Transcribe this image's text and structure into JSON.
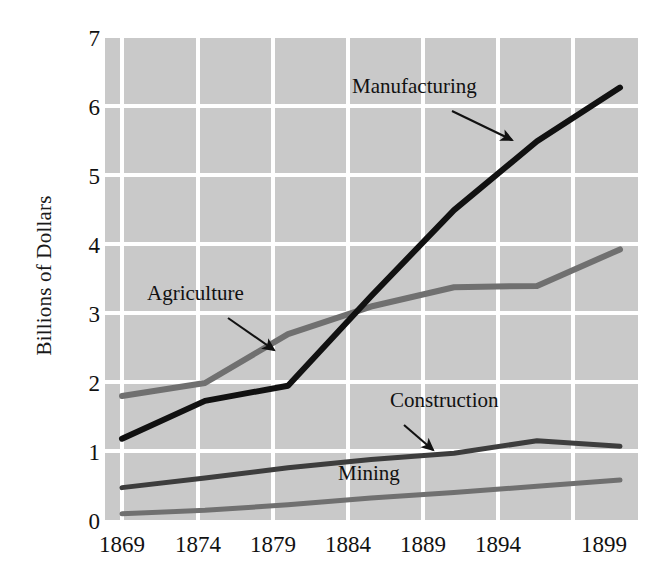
{
  "chart_data": {
    "type": "line",
    "title": "",
    "subtitle": "",
    "xlabel": "",
    "ylabel": "Billions of Dollars",
    "x": [
      1869,
      1874,
      1879,
      1884,
      1889,
      1894,
      1899
    ],
    "categories": [
      "1869",
      "1874",
      "1879",
      "1884",
      "1889",
      "1894",
      "1899"
    ],
    "xtick_labels": [
      "1869",
      "1874",
      "1879",
      "1884",
      "1889",
      "1894",
      "1899"
    ],
    "ytick_labels": [
      "0",
      "1",
      "2",
      "3",
      "4",
      "5",
      "6",
      "7"
    ],
    "ylim": [
      0,
      7
    ],
    "xlim": [
      1869,
      1899
    ],
    "grid": true,
    "grid_color": "#ffffff",
    "plot_background": "#c9c9c9",
    "legend_position": "inline-annotations",
    "series": [
      {
        "name": "Manufacturing",
        "color": "#111111",
        "width": 6,
        "values": [
          1.18,
          1.73,
          1.95,
          3.25,
          4.5,
          5.5,
          6.28
        ]
      },
      {
        "name": "Agriculture",
        "color": "#707070",
        "width": 6,
        "values": [
          1.8,
          1.99,
          2.7,
          3.1,
          3.38,
          3.4,
          3.93
        ]
      },
      {
        "name": "Construction",
        "color": "#3d3d3d",
        "width": 5,
        "values": [
          0.47,
          0.61,
          0.76,
          0.88,
          0.97,
          1.15,
          1.07
        ]
      },
      {
        "name": "Mining",
        "color": "#707070",
        "width": 5,
        "values": [
          0.09,
          0.14,
          0.22,
          0.32,
          0.4,
          0.49,
          0.58
        ]
      }
    ],
    "annotations": [
      {
        "label": "Manufacturing",
        "target_series": "Manufacturing",
        "target_x": 1889
      },
      {
        "label": "Agriculture",
        "target_series": "Agriculture",
        "target_x": 1877
      },
      {
        "label": "Construction",
        "target_series": "Construction",
        "target_x": 1890
      },
      {
        "label": "Mining",
        "target_series": "Mining",
        "target_x": 1886
      }
    ]
  },
  "axis": {
    "y_title": "Billions of Dollars",
    "y_ticks": [
      "7",
      "6",
      "5",
      "4",
      "3",
      "2",
      "1",
      "0"
    ],
    "x_ticks": [
      "1869",
      "1874",
      "1879",
      "1884",
      "1889",
      "1894",
      "1899"
    ]
  },
  "labels": {
    "manufacturing": "Manufacturing",
    "agriculture": "Agriculture",
    "construction": "Construction",
    "mining": "Mining"
  }
}
